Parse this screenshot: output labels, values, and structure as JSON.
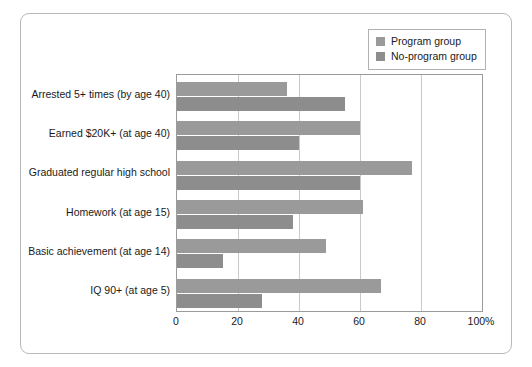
{
  "chart_data": {
    "type": "bar",
    "orientation": "horizontal",
    "title": "",
    "xlabel": "",
    "ylabel": "",
    "xlim": [
      0,
      100
    ],
    "xticks": [
      "0",
      "20",
      "40",
      "60",
      "80",
      "100%"
    ],
    "xtick_values": [
      0,
      20,
      40,
      60,
      80,
      100
    ],
    "grid": true,
    "legend_position": "top-right",
    "categories": [
      "Arrested 5+ times (by age 40)",
      "Earned $20K+ (at age 40)",
      "Graduated regular high school",
      "Homework (at age 15)",
      "Basic achievement (at age 14)",
      "IQ 90+ (at age 5)"
    ],
    "series": [
      {
        "name": "Program group",
        "color": "#9a9a9a",
        "values": [
          36,
          60,
          77,
          61,
          49,
          67
        ]
      },
      {
        "name": "No-program group",
        "color": "#8d8d8d",
        "values": [
          55,
          40,
          60,
          38,
          15,
          28
        ]
      }
    ]
  },
  "legend": {
    "items": [
      {
        "label": "Program group",
        "color": "#9a9a9a",
        "icon": "square-swatch-icon"
      },
      {
        "label": "No-program group",
        "color": "#8d8d8d",
        "icon": "square-swatch-icon"
      }
    ]
  },
  "colors": {
    "program": "#9a9a9a",
    "no_program": "#8d8d8d",
    "grid": "#c9c9c9",
    "axis": "#9b9b9b",
    "frame": "#b9b9b9",
    "text": "#1a1a1a",
    "background": "#ffffff"
  }
}
